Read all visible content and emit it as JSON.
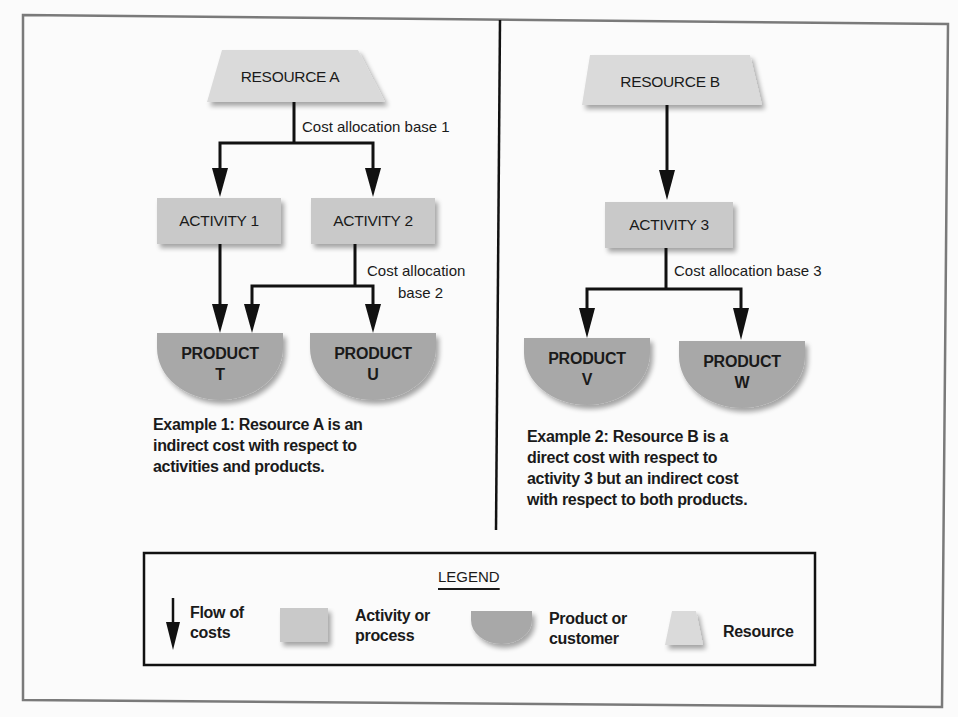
{
  "colors": {
    "activity_fill": "#c9c9c9",
    "product_fill": "#a8a8a8",
    "resource_fill": "#dadada",
    "line": "#111111",
    "frame": "#7a7a7a"
  },
  "example1": {
    "resource": "RESOURCE A",
    "cost_base_1": "Cost allocation base 1",
    "activities": [
      "ACTIVITY 1",
      "ACTIVITY 2"
    ],
    "cost_base_2_line1": "Cost allocation",
    "cost_base_2_line2": "base 2",
    "products": [
      {
        "line1": "PRODUCT",
        "line2": "T"
      },
      {
        "line1": "PRODUCT",
        "line2": "U"
      }
    ],
    "caption": [
      "Example 1: Resource A is an",
      "indirect cost with respect to",
      "activities and products."
    ]
  },
  "example2": {
    "resource": "RESOURCE B",
    "activity": "ACTIVITY 3",
    "cost_base_3": "Cost allocation base 3",
    "products": [
      {
        "line1": "PRODUCT",
        "line2": "V"
      },
      {
        "line1": "PRODUCT",
        "line2": "W"
      }
    ],
    "caption": [
      "Example 2: Resource B is a",
      "direct cost with respect to",
      "activity 3 but an indirect cost",
      "with respect to both products."
    ]
  },
  "legend": {
    "title": "LEGEND",
    "items": [
      {
        "icon": "down-arrow-icon",
        "line1": "Flow of",
        "line2": "costs"
      },
      {
        "icon": "rectangle-icon",
        "line1": "Activity or",
        "line2": "process"
      },
      {
        "icon": "half-disc-icon",
        "line1": "Product or",
        "line2": "customer"
      },
      {
        "icon": "trapezoid-icon",
        "line1": "Resource",
        "line2": ""
      }
    ]
  }
}
